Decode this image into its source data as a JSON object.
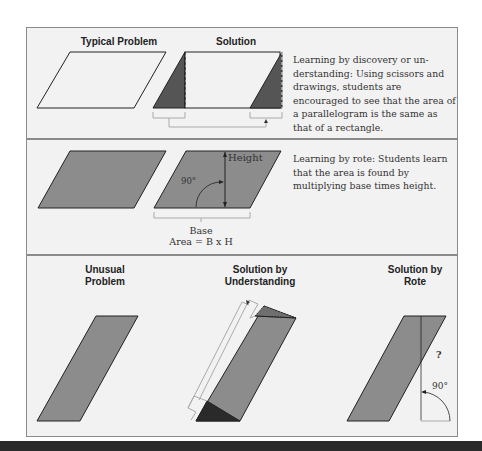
{
  "colors": {
    "panel_bg": "#f2f2f2",
    "frame": "#8a8a8a",
    "shape_fill": "#8c8c8c",
    "dark_fill": "#505050",
    "darkest_fill": "#2a2a2a",
    "outline": "#222222",
    "guide": "#b8b8b8"
  },
  "row1": {
    "heading_problem": "Typical Problem",
    "heading_solution": "Solution",
    "description": "Learning by discovery or un-derstanding: Using scissors and drawings, students are encouraged to see that the area of a parallelogram is the same as that of a rectangle."
  },
  "row2": {
    "height_label": "Height",
    "angle_label": "90°",
    "base_label": "Base",
    "formula_label": "Area = B x H",
    "description": "Learning by rote: Students learn that the area is found by multiplying base times height."
  },
  "row3": {
    "heading_unusual": "Unusual\nProblem",
    "heading_understanding": "Solution by\nUnderstanding",
    "heading_rote": "Solution by\nRote",
    "question_mark": "?",
    "angle_label": "90°"
  }
}
